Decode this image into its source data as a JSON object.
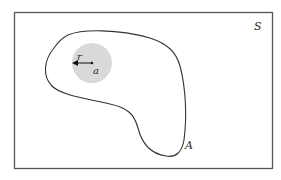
{
  "diagram": {
    "type": "set-diagram",
    "universe": {
      "label": "S",
      "stroke": "#555555",
      "fill": "#ffffff"
    },
    "region": {
      "label": "A",
      "stroke": "#333333"
    },
    "disk": {
      "fill": "#d9d9d9",
      "center_label": "a",
      "radius_label": "r"
    },
    "arrow": {
      "color": "#111111",
      "direction": "left"
    }
  }
}
